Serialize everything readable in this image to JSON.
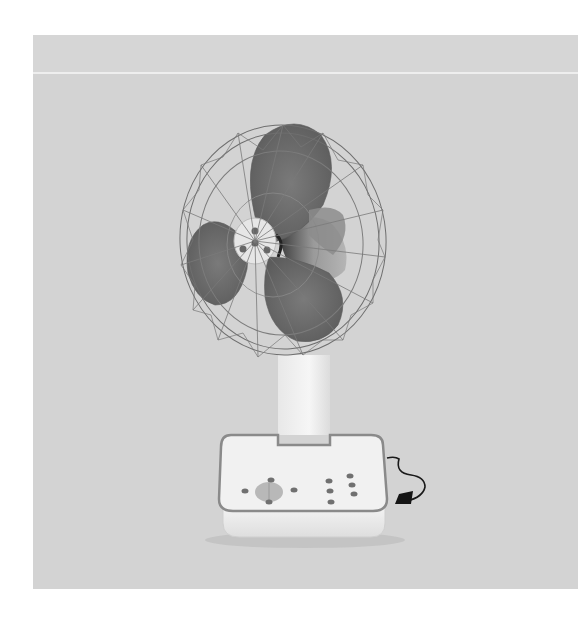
{
  "image": {
    "subject": "Desk fan with three grey blades, wire cage guard, white square base with control buttons and power cord",
    "colors": {
      "page_background": "#ffffff",
      "photo_background": "#d3d3d3",
      "blade": "#6a6a6a",
      "base": "#f0f0f0",
      "trim": "#8a8a8a",
      "cord": "#1a1a1a"
    }
  }
}
